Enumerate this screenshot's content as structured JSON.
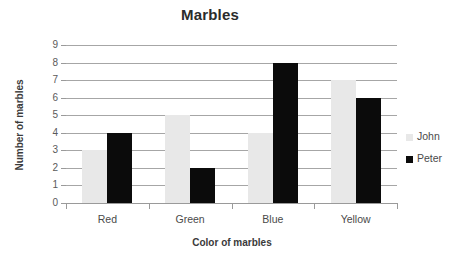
{
  "chart_data": {
    "type": "bar",
    "title": "Marbles",
    "xlabel": "Color of marbles",
    "ylabel": "Number of marbles",
    "categories": [
      "Red",
      "Green",
      "Blue",
      "Yellow"
    ],
    "series": [
      {
        "name": "John",
        "color": "#e8e8e8",
        "values": [
          3,
          5,
          4,
          7
        ]
      },
      {
        "name": "Peter",
        "color": "#0b0b0b",
        "values": [
          4,
          2,
          8,
          6
        ]
      }
    ],
    "ylim": [
      0,
      9
    ],
    "ytick_labels": [
      "9",
      "8",
      "7",
      "6",
      "5",
      "4",
      "3",
      "2",
      "1",
      "0"
    ],
    "ytick_values": [
      9,
      8,
      7,
      6,
      5,
      4,
      3,
      2,
      1,
      0
    ],
    "grid": true,
    "legend_position": "right",
    "gridline_color": "#a6a6a6",
    "axis_color": "#9a9a9a",
    "text_color": "#4a4a4a",
    "background": "#ffffff"
  }
}
